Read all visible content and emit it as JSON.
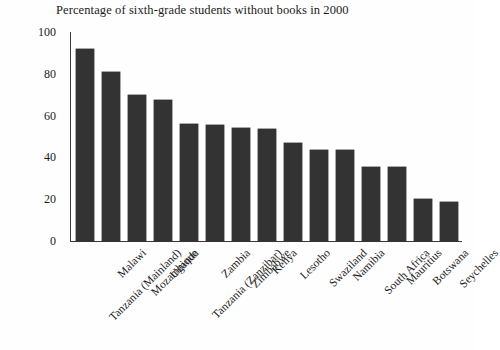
{
  "figure": {
    "background_color": "#fefefe",
    "bar_color": "#333333",
    "axis_color": "#3a3a3a",
    "text_color": "#1b1b1b"
  },
  "chart_data": {
    "type": "bar",
    "title": "Percentage of sixth-grade students without books in 2000",
    "xlabel": "",
    "ylabel": "",
    "ylim": [
      0,
      100
    ],
    "yticks": [
      0,
      20,
      40,
      60,
      80,
      100
    ],
    "grid": false,
    "legend": false,
    "orientation": "vertical",
    "categories": [
      "Tanzania (Mainland)",
      "Malawi",
      "Mozambique",
      "Uganda",
      "Tanzania (Zanzibar)",
      "Zambia",
      "Zimbabwe",
      "Kenya",
      "Lesotho",
      "Swaziland",
      "Namibia",
      "South Africa",
      "Mauritius",
      "Botswana",
      "Seychelles"
    ],
    "values": [
      92,
      81,
      70,
      67.5,
      56,
      55.5,
      54,
      53.5,
      47,
      43.5,
      43.5,
      35.5,
      35.5,
      20,
      18.5
    ]
  }
}
